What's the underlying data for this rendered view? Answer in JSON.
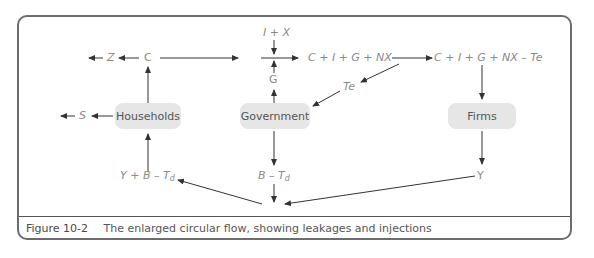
{
  "diagram": {
    "nodes": {
      "households": "Households",
      "government": "Government",
      "firms": "Firms"
    },
    "labels": {
      "z": "Z",
      "c": "C",
      "s": "S",
      "i_plus_x": "I + X",
      "g": "G",
      "aggregate_demand": "C + I + G + NX",
      "net_of_taxes": "C + I + G + NX – Te",
      "te": "Te",
      "y": "Y",
      "b_minus_td_b": "B – T",
      "b_minus_td_sub": "d",
      "y_plus_b_minus_td": "Y + B – T",
      "y_plus_b_minus_td_sub": "d"
    },
    "colors": {
      "frame": "#6d6d6d",
      "node_fill": "#e6e6e6",
      "label": "#8a8a8a",
      "arrow": "#333333"
    }
  },
  "caption": {
    "figure_number": "Figure 10-2",
    "text": "The enlarged circular flow, showing leakages and injections"
  }
}
